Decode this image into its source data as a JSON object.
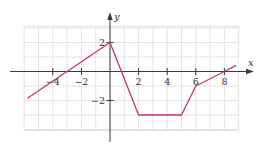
{
  "chart_data": {
    "type": "line",
    "title": "",
    "xlabel": "x",
    "ylabel": "y",
    "xlim": [
      -6,
      9
    ],
    "ylim": [
      -4,
      3
    ],
    "grid": true,
    "legend": null,
    "x_ticks": [
      -4,
      -2,
      2,
      4,
      6,
      8
    ],
    "x_tick_labels": [
      "−4",
      "−2",
      "2",
      "4",
      "6",
      "8"
    ],
    "y_ticks": [
      2,
      -2
    ],
    "y_tick_labels": [
      "2",
      "−2"
    ],
    "series": [
      {
        "name": "piecewise linear function",
        "color": "#c8385a",
        "points": [
          [
            -5.75,
            -1.83
          ],
          [
            0,
            2
          ],
          [
            2,
            -3
          ],
          [
            5,
            -3
          ],
          [
            6,
            -1
          ],
          [
            8,
            0
          ],
          [
            8.8,
            0.4
          ]
        ]
      }
    ]
  },
  "style": {
    "curve_color": "#c8385a",
    "grid_color": "#dcdcdc",
    "axis_color": "#3a3a3a"
  }
}
